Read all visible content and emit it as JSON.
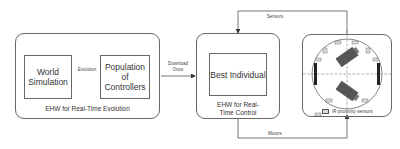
{
  "diagram": {
    "evolution_block": {
      "caption": "EHW for Real-Time Evolution",
      "world_simulation": "World Simulation",
      "population": "Population of Controllers",
      "link_label": "Evolution"
    },
    "download_label_line1": "Download",
    "download_label_line2": "Once",
    "control_block": {
      "caption_line1": "EHW for Real-",
      "caption_line2": "Time Control",
      "best_individual": "Best Individual"
    },
    "sensors_label": "Sensors",
    "motors_label": "Motors",
    "robot": {
      "legend": "IR proximity sensors",
      "sensor_numbers": [
        "0",
        "1",
        "2",
        "3",
        "4",
        "5",
        "6",
        "7"
      ]
    },
    "colors": {
      "line": "#666666",
      "text": "#333333",
      "wheel": "#222222",
      "motor": "#555555"
    }
  }
}
